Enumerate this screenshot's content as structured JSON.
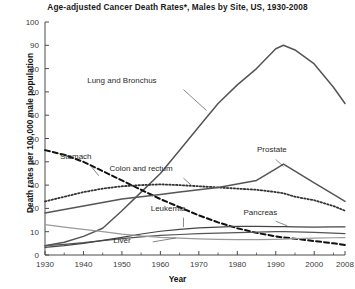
{
  "chart_data": {
    "type": "line",
    "title": "Age-adjusted Cancer Death Rates*, Males by Site, US, 1930-2008",
    "xlabel": "Year",
    "ylabel": "Death rates per 100,000 male population",
    "xlim": [
      1930,
      2008
    ],
    "ylim": [
      0,
      100
    ],
    "ytick_values": [
      0,
      10,
      20,
      30,
      40,
      50,
      60,
      70,
      80,
      90,
      100
    ],
    "ytick_labels": [
      "0",
      "10",
      "20",
      "30",
      "40",
      "50",
      "60",
      "70",
      "80",
      "90",
      "100"
    ],
    "xtick_values": [
      1930,
      1940,
      1950,
      1960,
      1970,
      1980,
      1990,
      2000,
      2008
    ],
    "xtick_labels": [
      "1930",
      "1940",
      "1950",
      "1960",
      "1970",
      "1980",
      "1990",
      "2000",
      "2008"
    ],
    "grid": false,
    "legend_position": "inline-annotations",
    "x": [
      1930,
      1935,
      1940,
      1945,
      1950,
      1955,
      1960,
      1965,
      1970,
      1975,
      1980,
      1985,
      1990,
      1992,
      1995,
      2000,
      2005,
      2008
    ],
    "series": [
      {
        "name": "Lung and Bronchus",
        "style": "solid",
        "color": "#555555",
        "width": 1.5,
        "label_x": 1950,
        "label_y": 74,
        "leader": [
          [
            1966,
            71
          ],
          [
            1972,
            62
          ]
        ],
        "values": [
          4.0,
          5.5,
          8.0,
          11.5,
          19.0,
          27.0,
          35.0,
          45.0,
          55.0,
          65.0,
          73.0,
          80.0,
          88.5,
          90.0,
          88.0,
          82.0,
          72.0,
          65.0
        ]
      },
      {
        "name": "Stomach",
        "style": "dashed",
        "color": "#111111",
        "width": 2.0,
        "label_x": 1938,
        "label_y": 41,
        "leader": [
          [
            1942,
            38
          ],
          [
            1944,
            34
          ]
        ],
        "values": [
          45.0,
          43.0,
          40.0,
          36.0,
          32.0,
          28.0,
          24.0,
          20.5,
          17.0,
          14.0,
          11.5,
          9.5,
          8.0,
          7.5,
          7.0,
          6.0,
          5.0,
          4.3
        ]
      },
      {
        "name": "Colon and rectum",
        "style": "dotted",
        "color": "#333333",
        "width": 1.8,
        "label_x": 1955,
        "label_y": 36,
        "leader": [
          [
            1966,
            33
          ],
          [
            1968,
            30
          ]
        ],
        "values": [
          23.0,
          25.0,
          27.0,
          28.5,
          29.5,
          30.0,
          30.3,
          30.0,
          29.5,
          29.0,
          28.5,
          28.0,
          27.0,
          26.5,
          25.0,
          23.5,
          21.0,
          19.0
        ]
      },
      {
        "name": "Prostate",
        "style": "solid",
        "color": "#555555",
        "width": 1.5,
        "label_x": 1989,
        "label_y": 44,
        "leader": [
          [
            1990,
            41
          ],
          [
            1992,
            38
          ]
        ],
        "values": [
          18.0,
          19.5,
          21.0,
          22.5,
          24.0,
          25.0,
          26.0,
          27.0,
          28.0,
          29.0,
          30.5,
          32.0,
          37.0,
          39.0,
          36.0,
          31.0,
          26.0,
          23.0
        ]
      },
      {
        "name": "Leukemia",
        "style": "solid",
        "color": "#555555",
        "width": 1.2,
        "label_x": 1962,
        "label_y": 19,
        "leader": [
          [
            1966,
            16
          ],
          [
            1966,
            12
          ]
        ],
        "values": [
          4.0,
          4.6,
          5.3,
          6.2,
          7.0,
          7.8,
          8.4,
          8.8,
          9.2,
          9.4,
          9.6,
          9.8,
          10.0,
          10.0,
          9.9,
          9.7,
          9.4,
          9.2
        ]
      },
      {
        "name": "Pancreas",
        "style": "solid",
        "color": "#444444",
        "width": 1.2,
        "label_x": 1986,
        "label_y": 17,
        "leader": [
          [
            1990,
            14.5
          ],
          [
            1993,
            12.5
          ]
        ],
        "values": [
          3.3,
          4.0,
          5.0,
          6.3,
          7.6,
          9.0,
          10.2,
          11.0,
          11.6,
          12.0,
          12.3,
          12.3,
          12.2,
          12.2,
          12.1,
          12.0,
          12.1,
          12.1
        ]
      },
      {
        "name": "Liver",
        "style": "solid",
        "color": "#9a9a9a",
        "width": 1.2,
        "label_x": 1950,
        "label_y": 5,
        "leader": [
          [
            1958,
            5.6
          ],
          [
            1964,
            7.3
          ]
        ],
        "values": [
          13.0,
          12.0,
          11.0,
          10.0,
          9.0,
          8.2,
          7.6,
          7.2,
          6.9,
          6.7,
          6.6,
          6.6,
          6.7,
          6.8,
          7.0,
          7.2,
          7.4,
          7.5
        ]
      }
    ]
  }
}
